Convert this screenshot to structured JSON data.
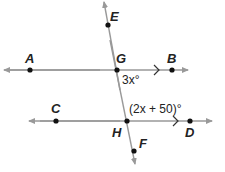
{
  "diagram": {
    "points": [
      {
        "id": "A",
        "label": "A"
      },
      {
        "id": "G",
        "label": "G"
      },
      {
        "id": "B",
        "label": "B"
      },
      {
        "id": "E",
        "label": "E"
      },
      {
        "id": "C",
        "label": "C"
      },
      {
        "id": "H",
        "label": "H"
      },
      {
        "id": "D",
        "label": "D"
      },
      {
        "id": "F",
        "label": "F"
      }
    ],
    "angles": {
      "at_G": "3x°",
      "at_H": "(2x + 50)°"
    },
    "colors": {
      "line": "#888888",
      "point": "#111111",
      "text": "#222222"
    }
  }
}
